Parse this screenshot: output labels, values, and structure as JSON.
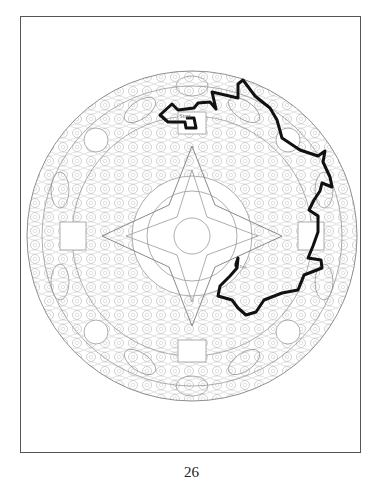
{
  "page": {
    "number": "26",
    "frame_color": "#555555",
    "background": "#ffffff"
  },
  "mandala": {
    "center": [
      192,
      236
    ],
    "radius": 165,
    "line_color": "#9a9a9a"
  },
  "maze_path": {
    "color": "#111111",
    "start_label": "Start",
    "end_label": "End"
  }
}
